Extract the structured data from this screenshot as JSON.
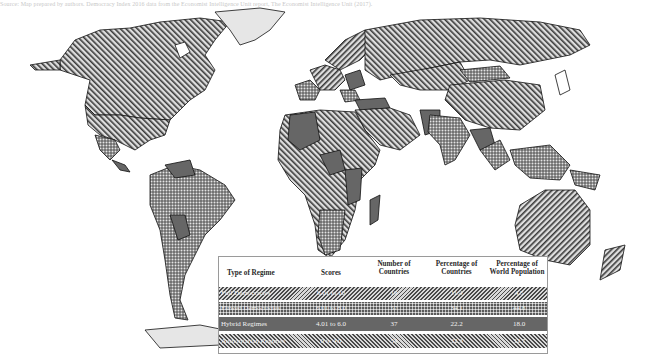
{
  "caption": "Source: Map prepared by authors. Democracy Index 2016 data from the Economist Intelligence Unit report, The Economist Intelligence Unit (2017).",
  "map": {
    "title": "World map of regime types",
    "patterns": {
      "full_democracy": "diagonal-hatch-left",
      "flawed_democracy": "checker-dots",
      "hybrid_regime": "solid-dark-gray",
      "authoritarian_regime": "diagonal-hatch-right",
      "no_data": "light-gray"
    },
    "colors": {
      "solid": "#666666",
      "hatch_line": "#4a4a4a",
      "hatch_bg": "#d8d8d8",
      "no_data": "#e6e6e6",
      "outline": "#111111"
    }
  },
  "table": {
    "headers": {
      "type": "Type of Regime",
      "scores": "Scores",
      "countries_l1": "Number of",
      "countries_l2": "Countries",
      "pct_countries_l1": "Percentage of",
      "pct_countries_l2": "Countries",
      "pct_pop_l1": "Percentage of",
      "pct_pop_l2": "World Population"
    },
    "rows": [
      {
        "type": "Full Democracies",
        "scores": "8.01 to 10",
        "countries": "19",
        "pct_countries": "11.4",
        "pct_population": "4.5",
        "pattern": "hatch"
      },
      {
        "type": "Flawed Democracies",
        "scores": "6.01 to 8.0",
        "countries": "57",
        "pct_countries": "34.1",
        "pct_population": "44.8",
        "pattern": "check"
      },
      {
        "type": "Hybrid Regimes",
        "scores": "4.01 to 6.0",
        "countries": "37",
        "pct_countries": "22.2",
        "pct_population": "18.0",
        "pattern": "solid"
      },
      {
        "type": "Authoritarian Regimes",
        "scores": "0 to 4.0",
        "countries": "54",
        "pct_countries": "32.3",
        "pct_population": "32.7",
        "pattern": "hatch2"
      }
    ]
  }
}
